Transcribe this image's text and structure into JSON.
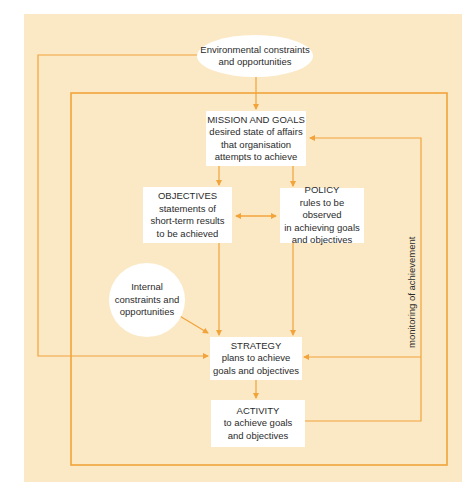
{
  "colors": {
    "panel_background": "#fbe9c6",
    "line": "#f2a33a",
    "node_fill": "#ffffff",
    "text": "#2b2b2b"
  },
  "nodes": {
    "environmental": {
      "lines": [
        "Environmental constraints",
        "and opportunities"
      ]
    },
    "mission": {
      "title": "MISSION AND GOALS",
      "lines": [
        "desired state of affairs",
        "that organisation",
        "attempts to achieve"
      ]
    },
    "objectives": {
      "title": "OBJECTIVES",
      "lines": [
        "statements of",
        "short-term results",
        "to be achieved"
      ]
    },
    "policy": {
      "title": "POLICY",
      "lines": [
        "rules to be observed",
        "in achieving goals",
        "and objectives"
      ]
    },
    "internal": {
      "lines": [
        "Internal",
        "constraints and",
        "opportunities"
      ]
    },
    "strategy": {
      "title": "STRATEGY",
      "lines": [
        "plans to achieve",
        "goals and objectives"
      ]
    },
    "activity": {
      "title": "ACTIVITY",
      "lines": [
        "to achieve goals",
        "and objectives"
      ]
    }
  },
  "labels": {
    "monitoring": "monitoring of achievement"
  }
}
